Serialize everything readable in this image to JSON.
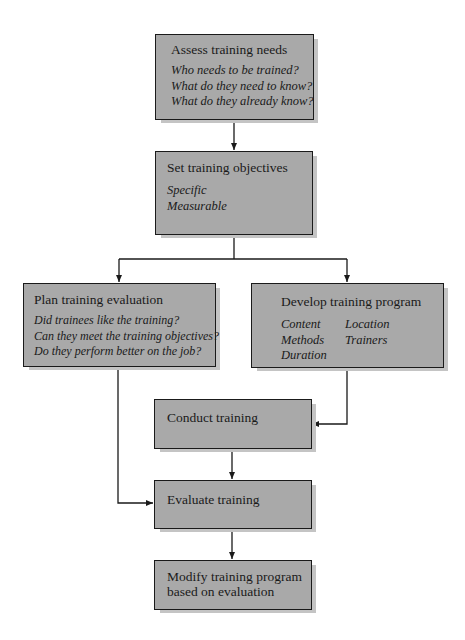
{
  "diagram": {
    "type": "flowchart",
    "nodes": {
      "assess": {
        "title": "Assess training needs",
        "items": [
          "Who needs to be trained?",
          "What do they need to know?",
          "What do they already know?"
        ]
      },
      "objectives": {
        "title": "Set training objectives",
        "items": [
          "Specific",
          "Measurable"
        ]
      },
      "plan_eval": {
        "title": "Plan training evaluation",
        "items": [
          "Did trainees like the training?",
          "Can they meet the training objectives?",
          "Do they perform better on the job?"
        ]
      },
      "develop": {
        "title": "Develop training program",
        "col1": [
          "Content",
          "Methods",
          "Duration"
        ],
        "col2": [
          "Location",
          "Trainers"
        ]
      },
      "conduct": {
        "title": "Conduct training"
      },
      "evaluate": {
        "title": "Evaluate training"
      },
      "modify": {
        "title_line1": "Modify training program",
        "title_line2": "based on evaluation"
      }
    },
    "edges": [
      {
        "from": "Assess training needs",
        "to": "Set training objectives"
      },
      {
        "from": "Set training objectives",
        "to": "Plan training evaluation"
      },
      {
        "from": "Set training objectives",
        "to": "Develop training program"
      },
      {
        "from": "Develop training program",
        "to": "Conduct training"
      },
      {
        "from": "Plan training evaluation",
        "to": "Evaluate training"
      },
      {
        "from": "Conduct training",
        "to": "Evaluate training"
      },
      {
        "from": "Evaluate training",
        "to": "Modify training program based on evaluation"
      }
    ],
    "colors": {
      "box_fill": "#a9a9a9",
      "box_border": "#1a1a1a",
      "shadow": "#c4c4c4",
      "connector": "#1a1a1a"
    }
  }
}
